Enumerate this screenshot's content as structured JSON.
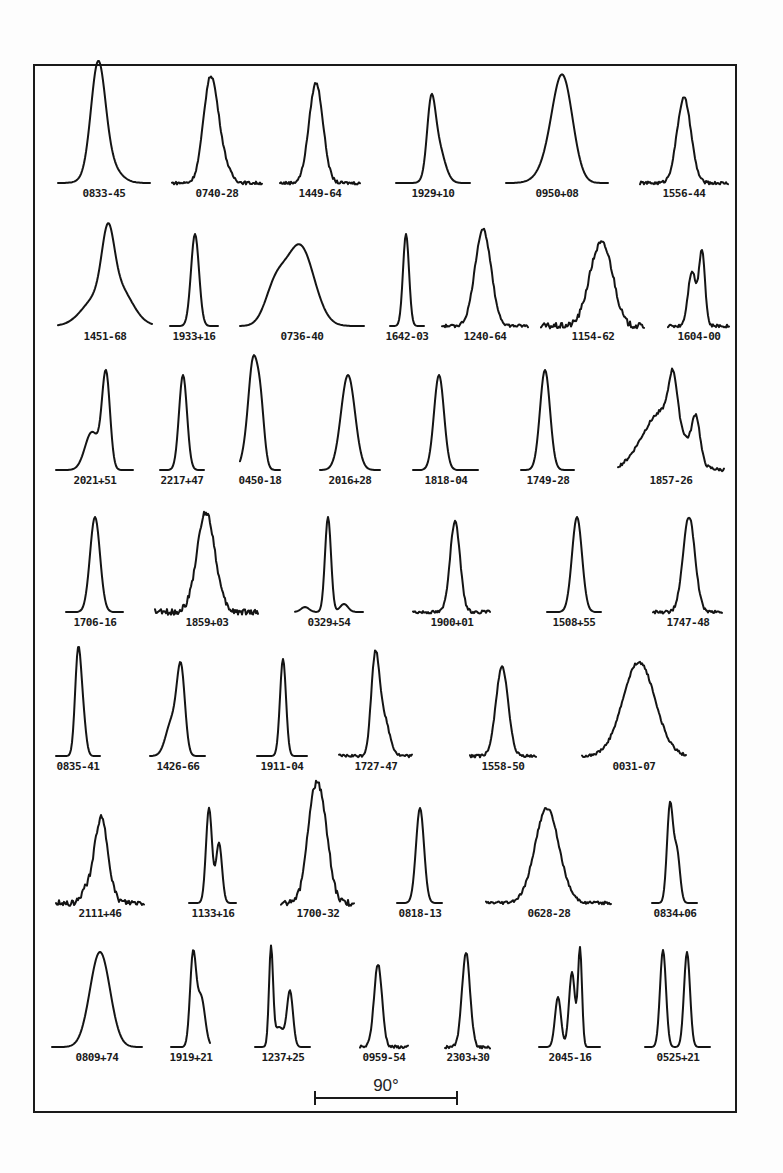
{
  "figure": {
    "scale_bar": {
      "label": "90°",
      "x1": 315,
      "x2": 457,
      "y": 1098
    },
    "ink_color": "#141414",
    "background": "#fdfdfd"
  },
  "chart_data": {
    "type": "line",
    "title": "",
    "xlabel": "pulse longitude",
    "ylabel": "intensity",
    "profiles": [
      {
        "name": "0833-45",
        "row": 0,
        "x0": 58,
        "x1": 150,
        "base": 183,
        "comps": [
          [
            98,
            7,
            100
          ],
          [
            104,
            12,
            25
          ]
        ],
        "noise": 0
      },
      {
        "name": "0740-28",
        "row": 0,
        "x0": 172,
        "x1": 262,
        "base": 183,
        "comps": [
          [
            210,
            7,
            95
          ],
          [
            220,
            8,
            25
          ]
        ],
        "noise": 1
      },
      {
        "name": "1449-64",
        "row": 0,
        "x0": 280,
        "x1": 360,
        "base": 183,
        "comps": [
          [
            316,
            7,
            100
          ]
        ],
        "noise": 1
      },
      {
        "name": "1929+10",
        "row": 0,
        "x0": 396,
        "x1": 470,
        "base": 183,
        "comps": [
          [
            431,
            4,
            60
          ],
          [
            437,
            7,
            40
          ]
        ],
        "noise": 0
      },
      {
        "name": "0950+08",
        "row": 0,
        "x0": 506,
        "x1": 608,
        "base": 183,
        "comps": [
          [
            563,
            10,
            95
          ],
          [
            552,
            12,
            20
          ]
        ],
        "noise": 0
      },
      {
        "name": "1556-44",
        "row": 0,
        "x0": 640,
        "x1": 728,
        "base": 183,
        "comps": [
          [
            684,
            7,
            85
          ]
        ],
        "noise": 1
      },
      {
        "name": "1451-68",
        "row": 1,
        "x0": 58,
        "x1": 152,
        "base": 326,
        "comps": [
          [
            108,
            6,
            60
          ],
          [
            118,
            14,
            38
          ],
          [
            94,
            14,
            22
          ]
        ],
        "noise": 0
      },
      {
        "name": "1933+16",
        "row": 1,
        "x0": 170,
        "x1": 218,
        "base": 326,
        "comps": [
          [
            195,
            4,
            92
          ]
        ],
        "noise": 0
      },
      {
        "name": "0736-40",
        "row": 1,
        "x0": 240,
        "x1": 364,
        "base": 326,
        "comps": [
          [
            300,
            14,
            80
          ],
          [
            275,
            10,
            35
          ]
        ],
        "noise": 0
      },
      {
        "name": "1642-03",
        "row": 1,
        "x0": 390,
        "x1": 424,
        "base": 326,
        "comps": [
          [
            406,
            3,
            92
          ]
        ],
        "noise": 0
      },
      {
        "name": "1240-64",
        "row": 1,
        "x0": 442,
        "x1": 528,
        "base": 326,
        "comps": [
          [
            483,
            8,
            97
          ]
        ],
        "noise": 1
      },
      {
        "name": "1154-62",
        "row": 1,
        "x0": 541,
        "x1": 644,
        "base": 326,
        "comps": [
          [
            598,
            10,
            70
          ],
          [
            610,
            8,
            30
          ]
        ],
        "noise": 2
      },
      {
        "name": "1604-00",
        "row": 1,
        "x0": 668,
        "x1": 729,
        "base": 326,
        "comps": [
          [
            692,
            4,
            55
          ],
          [
            702,
            3,
            75
          ]
        ],
        "noise": 1
      },
      {
        "name": "2021+51",
        "row": 2,
        "x0": 56,
        "x1": 133,
        "base": 470,
        "comps": [
          [
            106,
            4,
            95
          ],
          [
            92,
            7,
            38
          ]
        ],
        "noise": 0
      },
      {
        "name": "2217+47",
        "row": 2,
        "x0": 160,
        "x1": 204,
        "base": 470,
        "comps": [
          [
            183,
            4,
            95
          ]
        ],
        "noise": 0
      },
      {
        "name": "0450-18",
        "row": 2,
        "x0": 240,
        "x1": 280,
        "base": 470,
        "comps": [
          [
            253,
            4,
            80
          ],
          [
            260,
            4,
            70
          ],
          [
            248,
            5,
            30
          ]
        ],
        "noise": 0
      },
      {
        "name": "2016+28",
        "row": 2,
        "x0": 320,
        "x1": 380,
        "base": 470,
        "comps": [
          [
            348,
            7,
            95
          ]
        ],
        "noise": 0
      },
      {
        "name": "1818-04",
        "row": 2,
        "x0": 413,
        "x1": 478,
        "base": 470,
        "comps": [
          [
            439,
            5,
            95
          ]
        ],
        "noise": 0
      },
      {
        "name": "1749-28",
        "row": 2,
        "x0": 521,
        "x1": 574,
        "base": 470,
        "comps": [
          [
            545,
            5,
            100
          ]
        ],
        "noise": 0
      },
      {
        "name": "1857-26",
        "row": 2,
        "x0": 618,
        "x1": 724,
        "base": 470,
        "comps": [
          [
            673,
            4,
            45
          ],
          [
            696,
            4,
            42
          ],
          [
            670,
            16,
            50
          ],
          [
            648,
            15,
            25
          ]
        ],
        "noise": 1
      },
      {
        "name": "1706-16",
        "row": 3,
        "x0": 66,
        "x1": 123,
        "base": 612,
        "comps": [
          [
            95,
            5,
            95
          ]
        ],
        "noise": 0
      },
      {
        "name": "1859+03",
        "row": 3,
        "x0": 155,
        "x1": 258,
        "base": 612,
        "comps": [
          [
            206,
            9,
            100
          ]
        ],
        "noise": 2
      },
      {
        "name": "0329+54",
        "row": 3,
        "x0": 295,
        "x1": 363,
        "base": 612,
        "comps": [
          [
            328,
            3,
            95
          ],
          [
            305,
            4,
            5
          ],
          [
            344,
            4,
            8
          ]
        ],
        "noise": 0
      },
      {
        "name": "1900+01",
        "row": 3,
        "x0": 413,
        "x1": 490,
        "base": 612,
        "comps": [
          [
            455,
            5,
            90
          ]
        ],
        "noise": 1
      },
      {
        "name": "1508+55",
        "row": 3,
        "x0": 547,
        "x1": 601,
        "base": 612,
        "comps": [
          [
            577,
            5,
            95
          ]
        ],
        "noise": 0
      },
      {
        "name": "1747-48",
        "row": 3,
        "x0": 653,
        "x1": 722,
        "base": 612,
        "comps": [
          [
            689,
            6,
            95
          ]
        ],
        "noise": 1
      },
      {
        "name": "0835-41",
        "row": 4,
        "x0": 56,
        "x1": 100,
        "base": 756,
        "comps": [
          [
            78,
            3,
            100
          ],
          [
            83,
            3,
            35
          ]
        ],
        "noise": 0
      },
      {
        "name": "1426-66",
        "row": 4,
        "x0": 150,
        "x1": 205,
        "base": 756,
        "comps": [
          [
            181,
            4,
            82
          ],
          [
            172,
            6,
            35
          ]
        ],
        "noise": 0
      },
      {
        "name": "1911-04",
        "row": 4,
        "x0": 257,
        "x1": 307,
        "base": 756,
        "comps": [
          [
            283,
            3,
            97
          ]
        ],
        "noise": 0
      },
      {
        "name": "1727-47",
        "row": 4,
        "x0": 339,
        "x1": 412,
        "base": 756,
        "comps": [
          [
            375,
            4,
            88
          ],
          [
            383,
            6,
            40
          ]
        ],
        "noise": 1
      },
      {
        "name": "1558-50",
        "row": 4,
        "x0": 470,
        "x1": 536,
        "base": 756,
        "comps": [
          [
            502,
            6,
            90
          ]
        ],
        "noise": 1
      },
      {
        "name": "0031-07",
        "row": 4,
        "x0": 582,
        "x1": 686,
        "base": 756,
        "comps": [
          [
            639,
            16,
            94
          ]
        ],
        "noise": 1
      },
      {
        "name": "2111+46",
        "row": 5,
        "x0": 56,
        "x1": 144,
        "base": 903,
        "comps": [
          [
            101,
            7,
            85
          ],
          [
            85,
            4,
            10
          ]
        ],
        "noise": 2
      },
      {
        "name": "1133+16",
        "row": 5,
        "x0": 189,
        "x1": 236,
        "base": 903,
        "comps": [
          [
            209,
            3,
            95
          ],
          [
            219,
            3,
            60
          ]
        ],
        "noise": 0
      },
      {
        "name": "1700-32",
        "row": 5,
        "x0": 281,
        "x1": 354,
        "base": 903,
        "comps": [
          [
            313,
            7,
            85
          ],
          [
            323,
            7,
            70
          ]
        ],
        "noise": 2
      },
      {
        "name": "0818-13",
        "row": 5,
        "x0": 397,
        "x1": 442,
        "base": 903,
        "comps": [
          [
            420,
            4,
            95
          ]
        ],
        "noise": 0
      },
      {
        "name": "0628-28",
        "row": 5,
        "x0": 486,
        "x1": 611,
        "base": 903,
        "comps": [
          [
            547,
            12,
            95
          ]
        ],
        "noise": 1
      },
      {
        "name": "0834+06",
        "row": 5,
        "x0": 652,
        "x1": 697,
        "base": 903,
        "comps": [
          [
            670,
            3,
            98
          ],
          [
            677,
            3,
            50
          ]
        ],
        "noise": 0
      },
      {
        "name": "0809+74",
        "row": 6,
        "x0": 52,
        "x1": 142,
        "base": 1047,
        "comps": [
          [
            100,
            10,
            95
          ]
        ],
        "noise": 0
      },
      {
        "name": "1919+21",
        "row": 6,
        "x0": 171,
        "x1": 210,
        "base": 1047,
        "comps": [
          [
            193,
            3,
            90
          ],
          [
            201,
            4,
            50
          ]
        ],
        "noise": 0
      },
      {
        "name": "1237+25",
        "row": 6,
        "x0": 255,
        "x1": 310,
        "base": 1047,
        "comps": [
          [
            271,
            2,
            96
          ],
          [
            290,
            3,
            55
          ],
          [
            279,
            5,
            20
          ]
        ],
        "noise": 0
      },
      {
        "name": "0959-54",
        "row": 6,
        "x0": 360,
        "x1": 408,
        "base": 1047,
        "comps": [
          [
            378,
            4,
            83
          ]
        ],
        "noise": 1
      },
      {
        "name": "2303+30",
        "row": 6,
        "x0": 445,
        "x1": 490,
        "base": 1047,
        "comps": [
          [
            466,
            4,
            95
          ]
        ],
        "noise": 1
      },
      {
        "name": "2045-16",
        "row": 6,
        "x0": 539,
        "x1": 600,
        "base": 1047,
        "comps": [
          [
            558,
            3,
            50
          ],
          [
            572,
            3,
            75
          ],
          [
            580,
            2,
            98
          ]
        ],
        "noise": 0
      },
      {
        "name": "0525+21",
        "row": 6,
        "x0": 645,
        "x1": 710,
        "base": 1047,
        "comps": [
          [
            663,
            3,
            97
          ],
          [
            687,
            3,
            95
          ]
        ],
        "noise": 0
      }
    ],
    "scale_bar_label": "90°"
  }
}
